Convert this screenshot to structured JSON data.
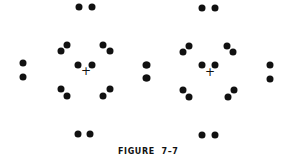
{
  "caption": "FIGURE  7–7",
  "colors": {
    "dot": "#111111",
    "background": "#ffffff"
  },
  "figures": [
    {
      "name": "left-pattern",
      "center_mark": {
        "x": 86,
        "y": 71,
        "glyph": "+"
      },
      "dots": [
        [
          79,
          7
        ],
        [
          92,
          7
        ],
        [
          23,
          63
        ],
        [
          23,
          77
        ],
        [
          146,
          65
        ],
        [
          146,
          78
        ],
        [
          61,
          51
        ],
        [
          67,
          45
        ],
        [
          103,
          45
        ],
        [
          110,
          51
        ],
        [
          78,
          65
        ],
        [
          92,
          65
        ],
        [
          61,
          89
        ],
        [
          67,
          96
        ],
        [
          103,
          96
        ],
        [
          110,
          89
        ],
        [
          78,
          134
        ],
        [
          90,
          134
        ]
      ]
    },
    {
      "name": "right-pattern",
      "center_mark": {
        "x": 210,
        "y": 72,
        "glyph": "+"
      },
      "dots": [
        [
          202,
          8
        ],
        [
          215,
          8
        ],
        [
          147,
          65
        ],
        [
          147,
          78
        ],
        [
          270,
          65
        ],
        [
          270,
          79
        ],
        [
          183,
          52
        ],
        [
          189,
          46
        ],
        [
          227,
          46
        ],
        [
          233,
          52
        ],
        [
          202,
          65
        ],
        [
          215,
          65
        ],
        [
          183,
          90
        ],
        [
          189,
          97
        ],
        [
          228,
          97
        ],
        [
          234,
          90
        ],
        [
          202,
          135
        ],
        [
          215,
          135
        ]
      ]
    }
  ]
}
